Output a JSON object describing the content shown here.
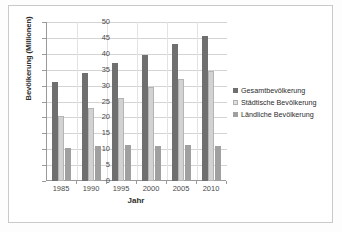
{
  "chart_data": {
    "type": "bar",
    "title": "",
    "xlabel": "Jahr",
    "ylabel": "Bevölkerung (Millionen)",
    "categories": [
      "1985",
      "1990",
      "1995",
      "2000",
      "2005",
      "2010"
    ],
    "series": [
      {
        "name": "Gesamtbevölkerung",
        "color": "#6f6f6f",
        "values": [
          31,
          34,
          37,
          39.5,
          43,
          45.5
        ]
      },
      {
        "name": "Städtische Bevölkerung",
        "color": "#d2d2d2",
        "values": [
          20.5,
          23,
          26,
          29.5,
          32,
          34.5
        ]
      },
      {
        "name": "Ländliche Bevölkerung",
        "color": "#a0a0a0",
        "values": [
          10.5,
          11,
          11.2,
          11,
          11.2,
          11
        ]
      }
    ],
    "ylim": [
      0,
      50
    ],
    "yticks": [
      "0",
      "5",
      "10",
      "15",
      "20",
      "25",
      "30",
      "35",
      "40",
      "45",
      "50"
    ],
    "grid": true,
    "legend_position": "right"
  }
}
